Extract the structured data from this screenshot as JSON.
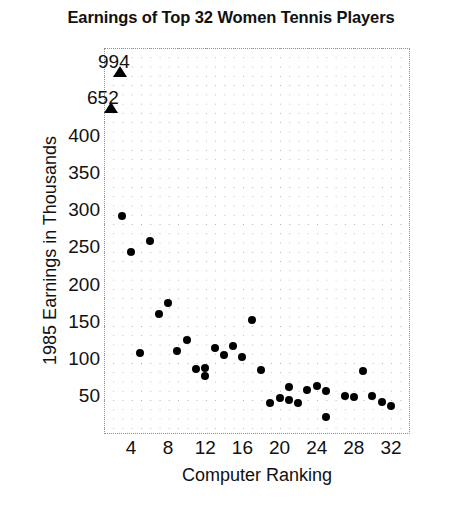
{
  "chart_data": {
    "type": "scatter",
    "title": "Earnings of Top 32 Women Tennis Players",
    "xlabel": "Computer Ranking",
    "ylabel": "1985 Earnings in Thousands",
    "xlim": [
      0,
      34
    ],
    "ylim": [
      0,
      430
    ],
    "grid": true,
    "legend": "none",
    "xticks": [
      4,
      8,
      12,
      16,
      20,
      24,
      28,
      32
    ],
    "yticks": [
      50,
      100,
      150,
      200,
      250,
      300,
      350,
      400
    ],
    "x": [
      1,
      2,
      3,
      4,
      6,
      7,
      8,
      5,
      9,
      10,
      11,
      12,
      13,
      14,
      15,
      16,
      17,
      18,
      19,
      20,
      21,
      22,
      23,
      24,
      25,
      26,
      27,
      28,
      29,
      30,
      31,
      32
    ],
    "y": [
      994,
      652,
      292,
      244,
      259,
      160,
      175,
      108,
      110,
      125,
      86,
      77,
      115,
      105,
      117,
      102,
      152,
      85,
      40,
      47,
      62,
      44,
      40,
      58,
      63,
      57,
      22,
      50,
      48,
      84,
      50,
      37
    ],
    "annotations": [
      {
        "label": "994",
        "x": 1,
        "y": 994,
        "note": "off-scale point marked with arrow"
      },
      {
        "label": "652",
        "x": 2,
        "y": 652,
        "note": "off-scale point marked with arrow"
      }
    ],
    "points": [
      {
        "rank": 3,
        "earnings": 292
      },
      {
        "rank": 4,
        "earnings": 244
      },
      {
        "rank": 5,
        "earnings": 108
      },
      {
        "rank": 6,
        "earnings": 259
      },
      {
        "rank": 7,
        "earnings": 160
      },
      {
        "rank": 8,
        "earnings": 175
      },
      {
        "rank": 9,
        "earnings": 110
      },
      {
        "rank": 10,
        "earnings": 125
      },
      {
        "rank": 11,
        "earnings": 86
      },
      {
        "rank": 12,
        "earnings": 88
      },
      {
        "rank": 12,
        "earnings": 77
      },
      {
        "rank": 13,
        "earnings": 115
      },
      {
        "rank": 14,
        "earnings": 105
      },
      {
        "rank": 15,
        "earnings": 117
      },
      {
        "rank": 16,
        "earnings": 102
      },
      {
        "rank": 17,
        "earnings": 152
      },
      {
        "rank": 18,
        "earnings": 85
      },
      {
        "rank": 19,
        "earnings": 40
      },
      {
        "rank": 20,
        "earnings": 47
      },
      {
        "rank": 21,
        "earnings": 62
      },
      {
        "rank": 21,
        "earnings": 44
      },
      {
        "rank": 22,
        "earnings": 40
      },
      {
        "rank": 23,
        "earnings": 58
      },
      {
        "rank": 24,
        "earnings": 63
      },
      {
        "rank": 25,
        "earnings": 57
      },
      {
        "rank": 25,
        "earnings": 22
      },
      {
        "rank": 27,
        "earnings": 50
      },
      {
        "rank": 28,
        "earnings": 48
      },
      {
        "rank": 29,
        "earnings": 84
      },
      {
        "rank": 30,
        "earnings": 50
      },
      {
        "rank": 31,
        "earnings": 42
      },
      {
        "rank": 32,
        "earnings": 37
      }
    ]
  },
  "colors": {
    "marker": "#000000",
    "text": "#111111",
    "grid": "#b9b9b9",
    "background": "#ffffff"
  }
}
